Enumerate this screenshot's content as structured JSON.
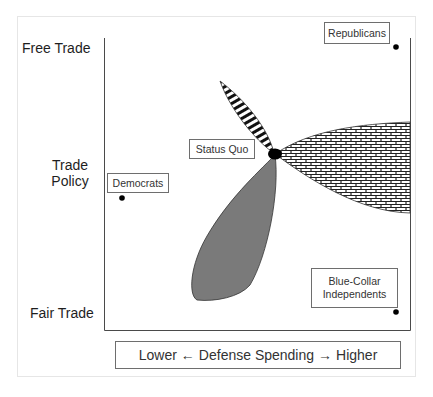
{
  "diagram": {
    "y_axis": {
      "title_line1": "Trade",
      "title_line2": "Policy",
      "top_label": "Free Trade",
      "bottom_label": "Fair Trade"
    },
    "x_axis": {
      "low": "Lower",
      "arrow_left": "←",
      "title": "Defense Spending",
      "arrow_right": "→",
      "high": "Higher"
    },
    "points": [
      {
        "id": "republicans",
        "label": "Republicans",
        "position": "top-right"
      },
      {
        "id": "democrats",
        "label": "Democrats",
        "position": "middle-left"
      },
      {
        "id": "status-quo",
        "label": "Status Quo",
        "position": "center"
      },
      {
        "id": "blue-collar",
        "label_line1": "Blue-Collar",
        "label_line2": "Independents",
        "position": "bottom-right"
      }
    ],
    "regions": [
      {
        "id": "striped-petal",
        "fill": "horizontal stripes",
        "direction": "up-left from status quo"
      },
      {
        "id": "brick-petal",
        "fill": "brick pattern",
        "direction": "right from status quo"
      },
      {
        "id": "gray-petal",
        "fill": "#7a7a7a",
        "direction": "down-left from status quo"
      }
    ],
    "colors": {
      "line": "#4a4a4a",
      "gray_fill": "#7a7a7a",
      "dot": "#000000"
    }
  }
}
